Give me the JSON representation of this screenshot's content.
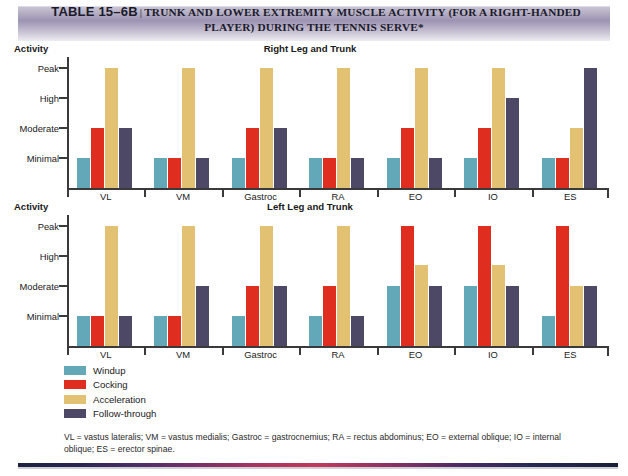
{
  "banner": {
    "table_number": "TABLE 15–6B",
    "separator": "|",
    "title_line1": "TRUNK AND LOWER EXTREMITY MUSCLE ACTIVITY (FOR A RIGHT-HANDED",
    "title_line2": "PLAYER) DURING THE TENNIS SERVE*"
  },
  "legend": {
    "items": [
      {
        "label": "Windup",
        "color": "#62a8b8"
      },
      {
        "label": "Cocking",
        "color": "#df2d20"
      },
      {
        "label": "Acceleration",
        "color": "#e3c173"
      },
      {
        "label": "Follow-through",
        "color": "#4c4866"
      }
    ]
  },
  "footnote": "VL = vastus lateralis; VM = vastus medialis; Gastroc = gastrocnemius; RA = rectus abdominus; EO = external oblique; IO = internal oblique; ES = erector spinae.",
  "chart_data": [
    {
      "type": "bar",
      "title": "Right Leg and Trunk",
      "ylabel": "Activity",
      "xlabel": "",
      "grid": false,
      "legend_position": "below-figure",
      "ytick_labels": [
        "Peak",
        "High",
        "Moderate",
        "Minimal"
      ],
      "ylevels": {
        "Minimal": 1,
        "Moderate": 2,
        "High": 3,
        "Peak": 4
      },
      "ylim": [
        0,
        4.35
      ],
      "categories": [
        "VL",
        "VM",
        "Gastroc",
        "RA",
        "EO",
        "IO",
        "ES"
      ],
      "series": [
        {
          "name": "Windup",
          "color": "#62a8b8",
          "levels": [
            "Minimal",
            "Minimal",
            "Minimal",
            "Minimal",
            "Minimal",
            "Minimal",
            "Minimal"
          ],
          "values": [
            1,
            1,
            1,
            1,
            1,
            1,
            1
          ]
        },
        {
          "name": "Cocking",
          "color": "#df2d20",
          "levels": [
            "Moderate",
            "Minimal",
            "Moderate",
            "Minimal",
            "Moderate",
            "Moderate",
            "Minimal"
          ],
          "values": [
            2,
            1,
            2,
            1,
            2,
            2,
            1
          ]
        },
        {
          "name": "Acceleration",
          "color": "#e3c173",
          "levels": [
            "Peak",
            "Peak",
            "Peak",
            "Peak",
            "Peak",
            "Peak",
            "Moderate"
          ],
          "values": [
            4,
            4,
            4,
            4,
            4,
            4,
            2
          ]
        },
        {
          "name": "Follow-through",
          "color": "#4c4866",
          "levels": [
            "Moderate",
            "Minimal",
            "Moderate",
            "Minimal",
            "Minimal",
            "High",
            "Peak"
          ],
          "values": [
            2,
            1,
            2,
            1,
            1,
            3,
            4
          ]
        }
      ]
    },
    {
      "type": "bar",
      "title": "Left Leg and Trunk",
      "ylabel": "Activity",
      "xlabel": "",
      "grid": false,
      "legend_position": "below-figure",
      "ytick_labels": [
        "Peak",
        "High",
        "Moderate",
        "Minimal"
      ],
      "ylevels": {
        "Minimal": 1,
        "Moderate": 2,
        "High": 3,
        "Peak": 4
      },
      "ylim": [
        0,
        4.35
      ],
      "categories": [
        "VL",
        "VM",
        "Gastroc",
        "RA",
        "EO",
        "IO",
        "ES"
      ],
      "series": [
        {
          "name": "Windup",
          "color": "#62a8b8",
          "levels": [
            "Minimal",
            "Minimal",
            "Minimal",
            "Minimal",
            "Moderate",
            "Moderate",
            "Minimal"
          ],
          "values": [
            1,
            1,
            1,
            1,
            2,
            2,
            1
          ]
        },
        {
          "name": "Cocking",
          "color": "#df2d20",
          "levels": [
            "Minimal",
            "Minimal",
            "Moderate",
            "Moderate",
            "Peak",
            "Peak",
            "Peak"
          ],
          "values": [
            1,
            1,
            2,
            2,
            4,
            4,
            4
          ]
        },
        {
          "name": "Acceleration",
          "color": "#e3c173",
          "levels": [
            "Peak",
            "Peak",
            "Peak",
            "Peak",
            "High",
            "High",
            "Moderate"
          ],
          "values": [
            4,
            4,
            4,
            4,
            2.7,
            2.7,
            2
          ]
        },
        {
          "name": "Follow-through",
          "color": "#4c4866",
          "levels": [
            "Minimal",
            "Moderate",
            "Moderate",
            "Minimal",
            "Moderate",
            "Moderate",
            "Moderate"
          ],
          "values": [
            1,
            2,
            2,
            1,
            2,
            2,
            2
          ]
        }
      ]
    }
  ]
}
